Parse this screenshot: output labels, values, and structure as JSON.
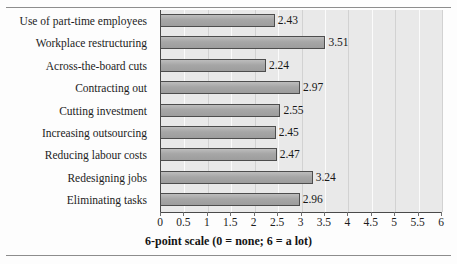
{
  "figure": {
    "cropped_title_fragment": "",
    "axis_title": "6-point scale (0 = none; 6 = a lot)"
  },
  "chart_data": {
    "type": "bar",
    "orientation": "horizontal",
    "title": "",
    "xlabel": "6-point scale (0 = none; 6 = a lot)",
    "ylabel": "",
    "xlim": [
      0,
      6
    ],
    "grid": true,
    "legend": "none",
    "tick_labels": [
      "0",
      "0.5",
      "1",
      "1.5",
      "2",
      "2.5",
      "3",
      "3.5",
      "4",
      "4.5",
      "5",
      "5.5",
      "6"
    ],
    "ticks": [
      0,
      0.5,
      1,
      1.5,
      2,
      2.5,
      3,
      3.5,
      4,
      4.5,
      5,
      5.5,
      6
    ],
    "categories": [
      "Use of part-time employees",
      "Workplace restructuring",
      "Across-the-board cuts",
      "Contracting out",
      "Cutting investment",
      "Increasing outsourcing",
      "Reducing labour costs",
      "Redesigning jobs",
      "Eliminating tasks"
    ],
    "values": [
      2.43,
      3.51,
      2.24,
      2.97,
      2.55,
      2.45,
      2.47,
      3.24,
      2.96
    ],
    "value_labels": [
      "2.43",
      "3.51",
      "2.24",
      "2.97",
      "2.55",
      "2.45",
      "2.47",
      "3.24",
      "2.96"
    ],
    "colors": {
      "bar_fill": "#a9a9a9",
      "bar_border": "#4d4d4d",
      "plot_background": "#e9e9e9",
      "gridline": "#d2d2d2",
      "axis": "#4a4a4a",
      "text": "#1c1c1c"
    }
  }
}
